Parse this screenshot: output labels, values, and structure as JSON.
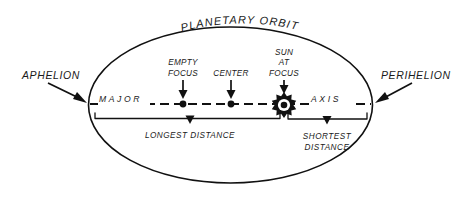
{
  "diagram": {
    "title": "PLANETARY ORBIT",
    "labels": {
      "aphelion": "APHELION",
      "perihelion": "PERIHELION",
      "empty_focus_line1": "EMPTY",
      "empty_focus_line2": "FOCUS",
      "center": "CENTER",
      "sun_line1": "SUN",
      "sun_line2": "AT",
      "sun_line3": "FOCUS",
      "major": "MAJOR",
      "axis": "AXIS",
      "longest_distance": "LONGEST DISTANCE",
      "shortest_line1": "SHORTEST",
      "shortest_line2": "DISTANCE"
    },
    "icons": {
      "sun": "sun-starburst-icon",
      "empty_focus": "focus-dot-icon",
      "center": "center-dot-icon",
      "aphelion_pointer": "arrow-icon",
      "perihelion_pointer": "arrow-icon"
    },
    "colors": {
      "ink": "#111111",
      "background": "#ffffff"
    }
  }
}
